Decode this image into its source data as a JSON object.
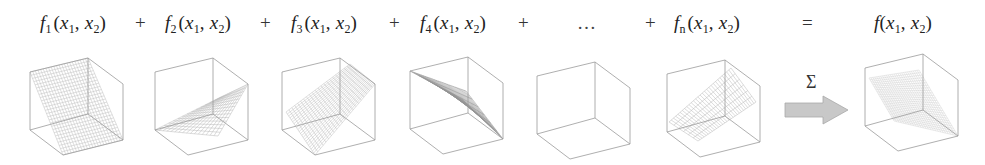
{
  "equation": {
    "terms": [
      {
        "fn": "f",
        "sub": "1",
        "x": 40
      },
      {
        "fn": "f",
        "sub": "2",
        "x": 165
      },
      {
        "fn": "f",
        "sub": "3",
        "x": 291
      },
      {
        "fn": "f",
        "sub": "4",
        "x": 420
      },
      {
        "fn": "…",
        "sub": "",
        "x": 577,
        "ellipsis": true
      },
      {
        "fn": "f",
        "sub": "n",
        "x": 674
      }
    ],
    "operators": [
      {
        "symbol": "+",
        "x": 135
      },
      {
        "symbol": "+",
        "x": 260
      },
      {
        "symbol": "+",
        "x": 389
      },
      {
        "symbol": "+",
        "x": 518
      },
      {
        "symbol": "+",
        "x": 645
      },
      {
        "symbol": "=",
        "x": 802
      }
    ],
    "args": {
      "open": "(",
      "v1": "x",
      "s1": "1",
      "sep": ", ",
      "v2": "x",
      "s2": "2",
      "close": ")"
    },
    "result": {
      "fn": "f",
      "x": 874
    }
  },
  "aggregation": {
    "symbol": "Σ",
    "arrow_label": "sum"
  },
  "cubes": [
    {
      "id": "f1",
      "ox": 30,
      "oy": 58,
      "surface": "steep-left-high",
      "density": "medium"
    },
    {
      "id": "f2",
      "ox": 155,
      "oy": 58,
      "surface": "ramp-right",
      "density": "medium"
    },
    {
      "id": "f3",
      "ox": 282,
      "oy": 58,
      "surface": "diagonal-checker",
      "density": "dense"
    },
    {
      "id": "f4",
      "ox": 410,
      "oy": 57,
      "surface": "thin-diagonal",
      "density": "very-dense"
    },
    {
      "id": "f5",
      "ox": 537,
      "oy": 62,
      "surface": "none",
      "density": "none"
    },
    {
      "id": "fn",
      "ox": 667,
      "oy": 60,
      "surface": "ramp-left-high",
      "density": "striped"
    },
    {
      "id": "f",
      "ox": 865,
      "oy": 54,
      "surface": "sum-plane",
      "density": "fine"
    }
  ],
  "colors": {
    "frame": "#9a9a9a",
    "mesh": "#8c8c8c",
    "arrow_fill": "#c8c8c8",
    "arrow_stroke": "#a8a8a8",
    "text": "#222222"
  }
}
